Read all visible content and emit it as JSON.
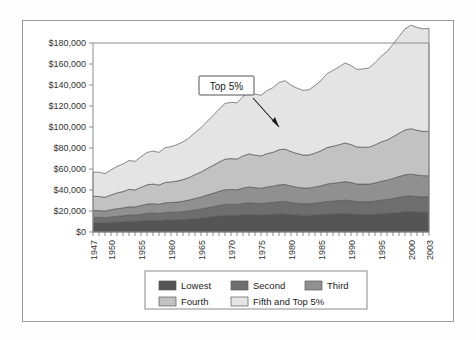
{
  "figure": {
    "frame_color": "#9a9a9a",
    "background": "#ffffff"
  },
  "annotation": {
    "label": "Top 5%",
    "box_fill": "#ffffff",
    "box_stroke": "#555555"
  },
  "legend": {
    "border_color": "#8a8a8a",
    "items": [
      {
        "label": "Lowest",
        "color": "#555555"
      },
      {
        "label": "Second",
        "color": "#6e6e6e"
      },
      {
        "label": "Third",
        "color": "#909090"
      },
      {
        "label": "Fourth",
        "color": "#c2c2c2"
      },
      {
        "label": "Fifth and Top 5%",
        "color": "#e4e4e4"
      }
    ]
  },
  "chart_data": {
    "type": "area",
    "stacked": true,
    "title": "",
    "xlabel": "",
    "ylabel": "",
    "grid": false,
    "legend_position": "bottom",
    "ylim": [
      0,
      180000
    ],
    "ytick_labels": [
      "$0",
      "$20,000",
      "$40,000",
      "$60,000",
      "$80,000",
      "$100,000",
      "$120,000",
      "$140,000",
      "$160,000",
      "$180,000"
    ],
    "ytick_values": [
      0,
      20000,
      40000,
      60000,
      80000,
      100000,
      120000,
      140000,
      160000,
      180000
    ],
    "xlim": [
      1947,
      2003
    ],
    "xtick_labels": [
      "1947",
      "1950",
      "1955",
      "1960",
      "1965",
      "1970",
      "1975",
      "1980",
      "1985",
      "1990",
      "1995",
      "2000",
      "2003"
    ],
    "xtick_values": [
      1947,
      1950,
      1955,
      1960,
      1965,
      1970,
      1975,
      1980,
      1985,
      1990,
      1995,
      2000,
      2003
    ],
    "x": [
      1947,
      1948,
      1949,
      1950,
      1951,
      1952,
      1953,
      1954,
      1955,
      1956,
      1957,
      1958,
      1959,
      1960,
      1961,
      1962,
      1963,
      1964,
      1965,
      1966,
      1967,
      1968,
      1969,
      1970,
      1971,
      1972,
      1973,
      1974,
      1975,
      1976,
      1977,
      1978,
      1979,
      1980,
      1981,
      1982,
      1983,
      1984,
      1985,
      1986,
      1987,
      1988,
      1989,
      1990,
      1991,
      1992,
      1993,
      1994,
      1995,
      1996,
      1997,
      1998,
      1999,
      2000,
      2001,
      2002,
      2003
    ],
    "series": [
      {
        "name": "Lowest",
        "color": "#555555",
        "values": [
          9000,
          8900,
          8700,
          9200,
          9500,
          9700,
          10200,
          10100,
          10600,
          11100,
          11200,
          11000,
          11500,
          11600,
          11700,
          12000,
          12400,
          12900,
          13400,
          14100,
          14700,
          15400,
          15900,
          16000,
          15900,
          16400,
          16700,
          16400,
          16200,
          16600,
          16800,
          17200,
          17200,
          16700,
          16300,
          16000,
          16000,
          16300,
          16600,
          17100,
          17300,
          17500,
          17700,
          17300,
          16800,
          16700,
          16700,
          17000,
          17500,
          17800,
          18300,
          18900,
          19400,
          19500,
          19100,
          18900,
          18900
        ]
      },
      {
        "name": "Second",
        "color": "#6e6e6e",
        "values": [
          5000,
          5000,
          4900,
          5200,
          5500,
          5700,
          6000,
          5900,
          6300,
          6700,
          6800,
          6600,
          7000,
          7100,
          7200,
          7400,
          7700,
          8100,
          8500,
          9000,
          9400,
          9900,
          10300,
          10400,
          10300,
          10800,
          11100,
          10900,
          10800,
          11100,
          11300,
          11700,
          11800,
          11400,
          11100,
          10900,
          10900,
          11200,
          11500,
          12000,
          12200,
          12400,
          12700,
          12500,
          12100,
          12100,
          12100,
          12400,
          12900,
          13200,
          13700,
          14200,
          14700,
          14900,
          14700,
          14500,
          14500
        ]
      },
      {
        "name": "Third",
        "color": "#909090",
        "values": [
          6500,
          6500,
          6300,
          6800,
          7200,
          7500,
          7900,
          7800,
          8300,
          8800,
          9000,
          8800,
          9300,
          9400,
          9600,
          9900,
          10300,
          10900,
          11400,
          12100,
          12700,
          13400,
          14000,
          14100,
          14000,
          14700,
          15100,
          14900,
          14700,
          15200,
          15500,
          16000,
          16200,
          15700,
          15300,
          15000,
          15000,
          15400,
          15900,
          16600,
          16900,
          17200,
          17600,
          17300,
          16800,
          16800,
          16800,
          17300,
          17900,
          18300,
          19000,
          19700,
          20400,
          20700,
          20400,
          20200,
          20200
        ]
      },
      {
        "name": "Fourth",
        "color": "#c2c2c2",
        "values": [
          13500,
          13400,
          13100,
          14100,
          15000,
          15600,
          16500,
          16300,
          17300,
          18300,
          18700,
          18300,
          19400,
          19600,
          20000,
          20600,
          21500,
          22700,
          23800,
          25200,
          26500,
          27900,
          29200,
          29400,
          29200,
          30600,
          31500,
          31000,
          30700,
          31700,
          32300,
          33400,
          33800,
          32800,
          32000,
          31400,
          31400,
          32200,
          33300,
          34700,
          35300,
          36000,
          36800,
          36200,
          35200,
          35200,
          35200,
          36200,
          37400,
          38300,
          39700,
          41200,
          42700,
          43300,
          42700,
          42300,
          42300
        ]
      },
      {
        "name": "Fifth and Top 5%",
        "color": "#e4e4e4",
        "values": [
          23000,
          23200,
          22600,
          23800,
          25300,
          26200,
          27500,
          27200,
          29100,
          30900,
          31400,
          31100,
          33000,
          33600,
          34700,
          35900,
          37700,
          40100,
          42200,
          44900,
          47500,
          50300,
          53000,
          53600,
          53600,
          56600,
          58700,
          58100,
          57800,
          60000,
          61600,
          64000,
          65100,
          63400,
          62300,
          61700,
          62200,
          64400,
          67000,
          70400,
          72200,
          74100,
          76200,
          75300,
          73900,
          74500,
          75400,
          78300,
          81600,
          84200,
          88100,
          92200,
          96300,
          98600,
          97900,
          97600,
          98100
        ]
      }
    ],
    "top_totals_note": "Top of stack = total; rises from about $57,000 in 1947 to about $174,000 in 2001 and about $174,000 in 2003"
  }
}
